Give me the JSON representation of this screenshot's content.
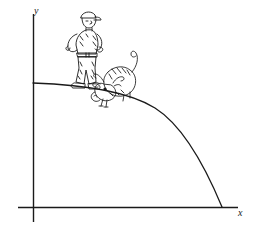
{
  "figure": {
    "kind": "cartoon-math-illustration",
    "background_color": "#ffffff",
    "ink_color": "#1a1a1a",
    "width": 259,
    "height": 229,
    "caption_text": "",
    "axes": {
      "x_label": "x",
      "y_label": "y",
      "origin": {
        "x": 33,
        "y": 207
      },
      "x_axis_from": {
        "x": 18,
        "y": 207
      },
      "x_axis_to": {
        "x": 238,
        "y": 207
      },
      "y_axis_from": {
        "x": 33,
        "y": 14
      },
      "y_axis_to": {
        "x": 33,
        "y": 222
      },
      "stroke_width": 1.4,
      "ticks": [],
      "tick_labels": [],
      "grid": false
    },
    "curve": {
      "name": "descending-arc",
      "description": "smooth concave-down arc falling from the y-axis to the x-axis",
      "start_point": {
        "x": 33,
        "y": 83
      },
      "end_point": {
        "x": 222,
        "y": 207
      },
      "control_points": [
        {
          "x": 120,
          "y": 86
        },
        {
          "x": 190,
          "y": 130
        }
      ],
      "stroke_width": 1.3
    },
    "characters": [
      {
        "name": "man-in-cap",
        "label": "man standing on the curve",
        "position": {
          "x": 82,
          "y": 50
        },
        "interactable": false
      },
      {
        "name": "bull",
        "label": "bull beside the man on the curve",
        "position": {
          "x": 112,
          "y": 86
        },
        "interactable": false
      }
    ]
  }
}
